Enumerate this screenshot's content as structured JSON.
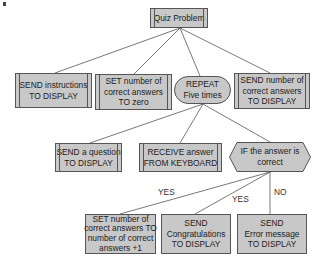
{
  "diagram": {
    "colors": {
      "box_fill": "#c8c8c8",
      "box_border": "#555555",
      "line": "#555555",
      "background": "#ffffff"
    },
    "root": {
      "lines": [
        "Quiz Problem"
      ]
    },
    "level1": [
      {
        "id": "send-instructions",
        "shape": "process",
        "lines": [
          "SEND instructions",
          "TO DISPLAY"
        ]
      },
      {
        "id": "set-correct-zero",
        "shape": "process",
        "lines": [
          "SET number of",
          "correct answers",
          "TO zero"
        ]
      },
      {
        "id": "repeat",
        "shape": "loop",
        "lines": [
          "REPEAT",
          "Five times"
        ]
      },
      {
        "id": "send-number-correct",
        "shape": "process",
        "lines": [
          "SEND number of",
          "correct answers",
          "TO DISPLAY"
        ]
      }
    ],
    "level2": [
      {
        "id": "send-question",
        "shape": "process",
        "lines": [
          "SEND a question",
          "TO DISPLAY"
        ]
      },
      {
        "id": "receive-answer",
        "shape": "process",
        "lines": [
          "RECEIVE answer",
          "FROM KEYBOARD"
        ]
      },
      {
        "id": "if-correct",
        "shape": "decision",
        "lines": [
          "IF the answer is",
          "correct"
        ]
      }
    ],
    "level3": [
      {
        "id": "set-correct-increment",
        "shape": "box",
        "lines": [
          "SET number of",
          "correct answers TO",
          "number of correct",
          "answers +1"
        ]
      },
      {
        "id": "send-congratulations",
        "shape": "box",
        "lines": [
          "SEND",
          "Congratulations",
          "TO DISPLAY"
        ]
      },
      {
        "id": "send-error",
        "shape": "box",
        "lines": [
          "SEND",
          "Error message",
          "TO DISPLAY"
        ]
      }
    ],
    "branch_labels": {
      "yes1": "YES",
      "yes2": "YES",
      "no": "NO"
    }
  }
}
